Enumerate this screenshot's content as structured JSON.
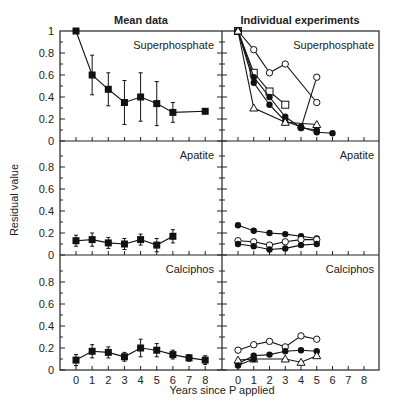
{
  "chart_data": {
    "type": "line",
    "ylabel": "Residual value",
    "xlabel": "Years since P applied",
    "columns": [
      "Mean data",
      "Individual experiments"
    ],
    "rows": [
      "Superphosphate",
      "Apatite",
      "Calciphos"
    ],
    "x_ticks": [
      0,
      1,
      2,
      3,
      4,
      5,
      6,
      7,
      8
    ],
    "ylim": [
      0,
      1.1
    ],
    "y_ticks_top": [
      "0",
      "0.2",
      "0.4",
      "0.6",
      "0.8",
      "1"
    ],
    "y_ticks_lower": [
      "0",
      "0.2",
      "0.4",
      "0.6",
      "0.8"
    ],
    "panels": [
      {
        "row": "Superphosphate",
        "column": "Mean data",
        "series": [
          {
            "name": "mean",
            "marker": "square-filled",
            "x": [
              0,
              1,
              2,
              3,
              4,
              5,
              6,
              8
            ],
            "y": [
              1.0,
              0.6,
              0.47,
              0.35,
              0.4,
              0.34,
              0.26,
              0.27
            ],
            "err": [
              0,
              0.18,
              0.15,
              0.2,
              0.22,
              0.2,
              0.09,
              0
            ]
          }
        ]
      },
      {
        "row": "Superphosphate",
        "column": "Individual experiments",
        "series": [
          {
            "name": "exp-open-circle-a",
            "marker": "circle-open",
            "x": [
              0,
              1,
              2,
              3,
              5
            ],
            "y": [
              1.0,
              0.83,
              0.62,
              0.7,
              0.35
            ]
          },
          {
            "name": "exp-open-circle-b",
            "marker": "circle-open",
            "x": [
              4,
              5
            ],
            "y": [
              0.12,
              0.58
            ]
          },
          {
            "name": "exp-open-square",
            "marker": "square-open",
            "x": [
              0,
              1,
              2,
              3
            ],
            "y": [
              1.0,
              0.62,
              0.45,
              0.33
            ]
          },
          {
            "name": "exp-filled-circle-a",
            "marker": "circle-filled",
            "x": [
              0,
              1,
              2,
              3,
              4,
              5
            ],
            "y": [
              1.0,
              0.58,
              0.4,
              0.22,
              0.12,
              0.1
            ]
          },
          {
            "name": "exp-filled-circle-b",
            "marker": "circle-filled",
            "x": [
              0,
              1,
              2,
              3,
              4,
              5,
              6
            ],
            "y": [
              1.0,
              0.53,
              0.33,
              0.18,
              0.13,
              0.08,
              0.07
            ]
          },
          {
            "name": "exp-open-triangle",
            "marker": "triangle-open",
            "x": [
              0,
              1,
              3,
              5
            ],
            "y": [
              1.0,
              0.3,
              0.17,
              0.15
            ]
          }
        ]
      },
      {
        "row": "Apatite",
        "column": "Mean data",
        "series": [
          {
            "name": "mean",
            "marker": "square-filled",
            "x": [
              0,
              1,
              2,
              3,
              4,
              5,
              6
            ],
            "y": [
              0.13,
              0.14,
              0.11,
              0.1,
              0.14,
              0.09,
              0.17
            ],
            "err": [
              0.05,
              0.06,
              0.05,
              0.05,
              0.05,
              0.06,
              0.06
            ]
          }
        ]
      },
      {
        "row": "Apatite",
        "column": "Individual experiments",
        "series": [
          {
            "name": "exp-filled-circle-a",
            "marker": "circle-filled",
            "x": [
              0,
              1,
              2,
              3,
              4,
              5
            ],
            "y": [
              0.27,
              0.22,
              0.2,
              0.19,
              0.17,
              0.15
            ]
          },
          {
            "name": "exp-open-circle",
            "marker": "circle-open",
            "x": [
              0,
              1,
              2,
              3,
              4,
              5
            ],
            "y": [
              0.13,
              0.12,
              0.09,
              0.12,
              0.14,
              0.14
            ]
          },
          {
            "name": "exp-filled-circle-b",
            "marker": "circle-filled",
            "x": [
              0,
              1,
              2,
              3,
              4,
              5
            ],
            "y": [
              0.1,
              0.08,
              0.05,
              0.06,
              0.09,
              0.1
            ]
          }
        ]
      },
      {
        "row": "Calciphos",
        "column": "Mean data",
        "series": [
          {
            "name": "mean",
            "marker": "square-filled",
            "x": [
              0,
              1,
              2,
              3,
              4,
              5,
              6,
              7,
              8
            ],
            "y": [
              0.09,
              0.17,
              0.16,
              0.12,
              0.2,
              0.18,
              0.14,
              0.11,
              0.09
            ],
            "err": [
              0.05,
              0.06,
              0.05,
              0.04,
              0.08,
              0.06,
              0.04,
              0.03,
              0.04
            ]
          }
        ]
      },
      {
        "row": "Calciphos",
        "column": "Individual experiments",
        "series": [
          {
            "name": "exp-open-circle",
            "marker": "circle-open",
            "x": [
              0,
              1,
              2,
              3,
              4,
              5
            ],
            "y": [
              0.18,
              0.23,
              0.26,
              0.21,
              0.31,
              0.28
            ]
          },
          {
            "name": "exp-filled-circle",
            "marker": "circle-filled",
            "x": [
              0,
              1,
              2,
              3,
              4,
              5
            ],
            "y": [
              0.06,
              0.13,
              0.14,
              0.17,
              0.18,
              0.17
            ]
          },
          {
            "name": "exp-open-triangle",
            "marker": "triangle-open",
            "x": [
              0,
              1,
              3,
              4,
              5
            ],
            "y": [
              0.09,
              0.1,
              0.1,
              0.07,
              0.13
            ]
          },
          {
            "name": "exp-filled-small",
            "marker": "circle-filled",
            "x": [
              0,
              1
            ],
            "y": [
              0.04,
              0.1
            ]
          }
        ]
      }
    ]
  }
}
